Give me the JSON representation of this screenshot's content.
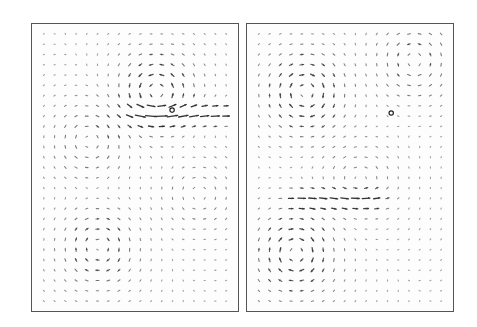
{
  "figure": {
    "panels": [
      {
        "id": "left",
        "grid": {
          "cols": 18,
          "rows": 27
        },
        "marker": {
          "u": 0.68,
          "v": 0.3
        },
        "vortices": [
          {
            "u": 0.62,
            "v": 0.22,
            "strength": 1.0,
            "sense": "ccw"
          },
          {
            "u": 0.25,
            "v": 0.4,
            "strength": 0.55,
            "sense": "cw"
          },
          {
            "u": 0.3,
            "v": 0.8,
            "strength": 0.75,
            "sense": "cw"
          },
          {
            "u": 0.85,
            "v": 0.6,
            "strength": 0.35,
            "sense": "ccw"
          }
        ],
        "jet": {
          "v": 0.3,
          "u_from": 0.55,
          "u_to": 0.95,
          "strength": 0.9
        }
      },
      {
        "id": "right",
        "grid": {
          "cols": 18,
          "rows": 27
        },
        "marker": {
          "u": 0.7,
          "v": 0.31
        },
        "vortices": [
          {
            "u": 0.25,
            "v": 0.22,
            "strength": 1.0,
            "sense": "cw"
          },
          {
            "u": 0.85,
            "v": 0.1,
            "strength": 0.6,
            "sense": "ccw"
          },
          {
            "u": 0.2,
            "v": 0.82,
            "strength": 1.0,
            "sense": "cw"
          },
          {
            "u": 0.55,
            "v": 0.55,
            "strength": 0.35,
            "sense": "ccw"
          }
        ],
        "jet": {
          "v": 0.62,
          "u_from": 0.25,
          "u_to": 0.6,
          "strength": 0.7
        }
      }
    ],
    "colors": {
      "arrow": "#333333",
      "border": "#555555",
      "background": "#ffffff"
    }
  }
}
